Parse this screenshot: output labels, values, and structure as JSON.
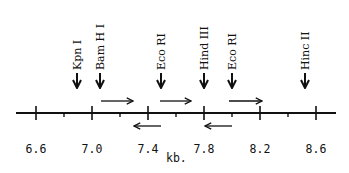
{
  "diagram": {
    "type": "restriction-map",
    "axis": {
      "unit_label": "kb.",
      "major_ticks": [
        {
          "value": 6.6,
          "label": "6.6",
          "x": 36
        },
        {
          "value": 7.0,
          "label": "7.0",
          "x": 92
        },
        {
          "value": 7.4,
          "label": "7.4",
          "x": 148
        },
        {
          "value": 7.8,
          "label": "7.8",
          "x": 204
        },
        {
          "value": 8.2,
          "label": "8.2",
          "x": 260
        },
        {
          "value": 8.6,
          "label": "8.6",
          "x": 316
        }
      ],
      "minor_ticks_x": [
        64,
        120,
        176,
        232,
        288
      ]
    },
    "sites": [
      {
        "label": "Kpn I",
        "x": 77
      },
      {
        "label": "Bam H I",
        "x": 100
      },
      {
        "label": "Eco RI",
        "x": 161
      },
      {
        "label": "Hind III",
        "x": 204
      },
      {
        "label": "Eco RI",
        "x": 232
      },
      {
        "label": "Hinc II",
        "x": 305
      }
    ],
    "forward_arrows": [
      {
        "x1": 101,
        "x2": 133
      },
      {
        "x1": 160,
        "x2": 191
      },
      {
        "x1": 229,
        "x2": 262
      }
    ],
    "reverse_arrows": [
      {
        "x1": 134,
        "x2": 161
      },
      {
        "x1": 205,
        "x2": 232
      }
    ]
  }
}
